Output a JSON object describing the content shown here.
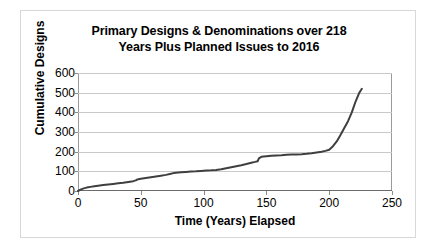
{
  "chart_data": {
    "type": "line",
    "title": "Primary Designs & Denominations over 218 Years Plus Planned Issues to 2016",
    "title_lines": [
      "Primary Designs & Denominations over 218",
      "Years Plus Planned Issues to 2016"
    ],
    "xlabel": "Time (Years) Elapsed",
    "ylabel": "Cumulative Designs",
    "xlim": [
      0,
      250
    ],
    "ylim": [
      0,
      600
    ],
    "xticks": [
      0,
      50,
      100,
      150,
      200,
      250
    ],
    "yticks": [
      0,
      100,
      200,
      300,
      400,
      500,
      600
    ],
    "xtick_labels": [
      "0",
      "50",
      "100",
      "150",
      "200",
      "250"
    ],
    "ytick_labels": [
      "0",
      "100",
      "200",
      "300",
      "400",
      "500",
      "600"
    ],
    "grid": "horizontal",
    "legend": "none",
    "line_color": "#3f3f3f",
    "line_width": 2,
    "series": [
      {
        "name": "Cumulative Designs",
        "x": [
          0,
          2,
          4,
          6,
          8,
          10,
          13,
          16,
          20,
          24,
          28,
          32,
          36,
          40,
          44,
          46,
          47,
          48,
          50,
          54,
          58,
          62,
          66,
          70,
          74,
          76,
          78,
          82,
          86,
          90,
          94,
          98,
          102,
          106,
          110,
          114,
          118,
          122,
          126,
          130,
          134,
          138,
          141,
          143,
          144,
          146,
          150,
          154,
          158,
          162,
          166,
          170,
          174,
          178,
          182,
          186,
          190,
          194,
          197,
          200,
          203,
          206,
          209,
          212,
          215,
          218,
          221,
          224,
          226
        ],
        "y": [
          0,
          7,
          12,
          16,
          19,
          21,
          24,
          27,
          30,
          33,
          36,
          39,
          42,
          46,
          50,
          54,
          58,
          60,
          62,
          66,
          70,
          74,
          78,
          82,
          88,
          91,
          93,
          95,
          97,
          99,
          100,
          102,
          104,
          105,
          107,
          111,
          116,
          121,
          126,
          131,
          137,
          144,
          148,
          151,
          166,
          174,
          177,
          179,
          181,
          182,
          184,
          185,
          186,
          187,
          189,
          192,
          196,
          200,
          204,
          210,
          228,
          252,
          285,
          320,
          355,
          400,
          455,
          500,
          520
        ]
      }
    ]
  }
}
